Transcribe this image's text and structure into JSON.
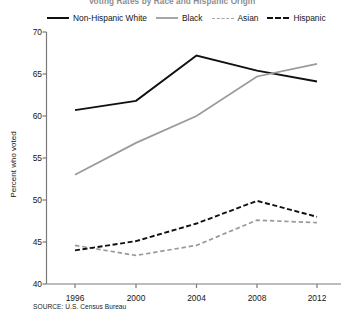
{
  "chart_data": {
    "type": "line",
    "title": "Voting Rates by Race and Hispanic Origin",
    "xlabel": "",
    "ylabel": "Percent who voted",
    "categories": [
      "1996",
      "2000",
      "2004",
      "2008",
      "2012"
    ],
    "x": [
      1996,
      2000,
      2004,
      2008,
      2012
    ],
    "ylim": [
      40,
      70
    ],
    "yticks": [
      40,
      45,
      50,
      55,
      60,
      65,
      70
    ],
    "xticks": [
      "1996",
      "2000",
      "2004",
      "2008",
      "2012"
    ],
    "grid": false,
    "legend_position": "top",
    "series": [
      {
        "name": "Non-Hispanic White",
        "values": [
          60.7,
          61.8,
          67.2,
          65.4,
          64.1
        ],
        "color": "#111111",
        "style": "solid",
        "width": 2.0
      },
      {
        "name": "Black",
        "values": [
          53.0,
          56.8,
          60.0,
          64.7,
          66.2
        ],
        "color": "#9a9a9a",
        "style": "solid",
        "width": 1.7
      },
      {
        "name": "Asian",
        "values": [
          44.6,
          43.4,
          44.6,
          47.6,
          47.3
        ],
        "color": "#9a9a9a",
        "style": "dashed",
        "width": 1.7
      },
      {
        "name": "Hispanic",
        "values": [
          44.0,
          45.1,
          47.2,
          49.9,
          48.0
        ],
        "color": "#111111",
        "style": "dashed",
        "width": 1.9
      }
    ]
  },
  "source_note": "SOURCE: U.S. Census Bureau",
  "axis_colors": {
    "axis_line": "#7a7a7a",
    "tick": "#7a7a7a",
    "text": "#161616"
  }
}
